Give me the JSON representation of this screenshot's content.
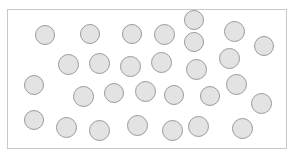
{
  "figure": {
    "title": "",
    "kind": "scatter-of-circles",
    "canvas": {
      "width": 294,
      "height": 160,
      "background": "#ffffff"
    },
    "frame": {
      "name": "plot-frame",
      "x": 7,
      "y": 9,
      "width": 280,
      "height": 140,
      "border_color": "#c8c8c8",
      "border_width": 1,
      "fill": "#ffffff"
    },
    "marker_style": {
      "shape": "circle",
      "fill": "#e3e3e3",
      "stroke": "#9a9a9a",
      "stroke_width": 1,
      "default_diameter": 20
    },
    "count": 29,
    "circles": [
      {
        "id": 1,
        "cx": 45,
        "cy": 35,
        "d": 20
      },
      {
        "id": 2,
        "cx": 90,
        "cy": 34,
        "d": 20
      },
      {
        "id": 3,
        "cx": 132,
        "cy": 34,
        "d": 20
      },
      {
        "id": 4,
        "cx": 164,
        "cy": 34,
        "d": 21
      },
      {
        "id": 5,
        "cx": 194,
        "cy": 42,
        "d": 20
      },
      {
        "id": 6,
        "cx": 234,
        "cy": 31,
        "d": 21
      },
      {
        "id": 7,
        "cx": 264,
        "cy": 46,
        "d": 20
      },
      {
        "id": 8,
        "cx": 68,
        "cy": 64,
        "d": 21
      },
      {
        "id": 9,
        "cx": 99,
        "cy": 63,
        "d": 21
      },
      {
        "id": 10,
        "cx": 130,
        "cy": 66,
        "d": 21
      },
      {
        "id": 11,
        "cx": 161,
        "cy": 62,
        "d": 21
      },
      {
        "id": 12,
        "cx": 196,
        "cy": 69,
        "d": 21
      },
      {
        "id": 13,
        "cx": 229,
        "cy": 58,
        "d": 21
      },
      {
        "id": 14,
        "cx": 34,
        "cy": 85,
        "d": 20
      },
      {
        "id": 15,
        "cx": 83,
        "cy": 96,
        "d": 21
      },
      {
        "id": 16,
        "cx": 114,
        "cy": 93,
        "d": 20
      },
      {
        "id": 17,
        "cx": 145,
        "cy": 91,
        "d": 21
      },
      {
        "id": 18,
        "cx": 174,
        "cy": 95,
        "d": 20
      },
      {
        "id": 19,
        "cx": 210,
        "cy": 96,
        "d": 20
      },
      {
        "id": 20,
        "cx": 236,
        "cy": 84,
        "d": 21
      },
      {
        "id": 21,
        "cx": 261,
        "cy": 103,
        "d": 21
      },
      {
        "id": 22,
        "cx": 34,
        "cy": 120,
        "d": 20
      },
      {
        "id": 23,
        "cx": 66,
        "cy": 127,
        "d": 21
      },
      {
        "id": 24,
        "cx": 99,
        "cy": 130,
        "d": 21
      },
      {
        "id": 25,
        "cx": 137,
        "cy": 125,
        "d": 21
      },
      {
        "id": 26,
        "cx": 172,
        "cy": 130,
        "d": 21
      },
      {
        "id": 27,
        "cx": 198,
        "cy": 126,
        "d": 21
      },
      {
        "id": 28,
        "cx": 242,
        "cy": 128,
        "d": 21
      },
      {
        "id": 29,
        "cx": 194,
        "cy": 20,
        "d": 0
      }
    ]
  }
}
